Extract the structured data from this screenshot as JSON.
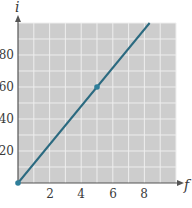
{
  "chart_data": {
    "type": "line",
    "title": "",
    "xlabel": "f",
    "ylabel": "i",
    "xlim": [
      0,
      10
    ],
    "ylim": [
      0,
      100
    ],
    "x_ticks": [
      2,
      4,
      6,
      8
    ],
    "y_ticks": [
      20,
      40,
      60,
      80
    ],
    "grid": true,
    "grid_step_x": 1,
    "grid_step_y": 10,
    "series": [
      {
        "name": "i vs f",
        "x": [
          0,
          8.33
        ],
        "y": [
          0,
          100
        ],
        "slope": 12
      }
    ],
    "marked_points": [
      {
        "x": 0,
        "y": 0
      },
      {
        "x": 5,
        "y": 60
      }
    ],
    "colors": {
      "line": "#2b6a80",
      "point": "#2f7f9a",
      "plot_background": "#cdcdcd",
      "grid": "#eeeeee",
      "axis": "#555555"
    }
  },
  "labels": {
    "x_axis": "f",
    "y_axis": "i",
    "x_ticks": [
      "2",
      "4",
      "6",
      "8"
    ],
    "y_ticks": [
      "20",
      "40",
      "60",
      "80"
    ]
  }
}
